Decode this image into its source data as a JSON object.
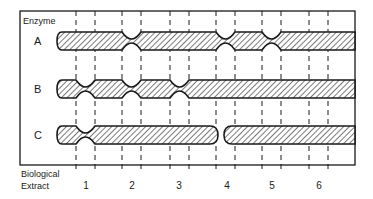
{
  "title_label": "Enzyme",
  "enzymes": [
    {
      "label": "A",
      "notches_at_extract": [
        2,
        4,
        5
      ],
      "cut_at_extract": null
    },
    {
      "label": "B",
      "notches_at_extract": [
        1,
        2,
        3
      ],
      "cut_at_extract": null
    },
    {
      "label": "C",
      "notches_at_extract": [
        1
      ],
      "cut_at_extract": 4
    }
  ],
  "xaxis": {
    "label_line1": "Biological",
    "label_line2": "Extract",
    "extracts": [
      "1",
      "2",
      "3",
      "4",
      "5",
      "6"
    ]
  },
  "colors": {
    "stroke": "#1a1a1a",
    "hatch": "#333333",
    "background": "#ffffff"
  }
}
